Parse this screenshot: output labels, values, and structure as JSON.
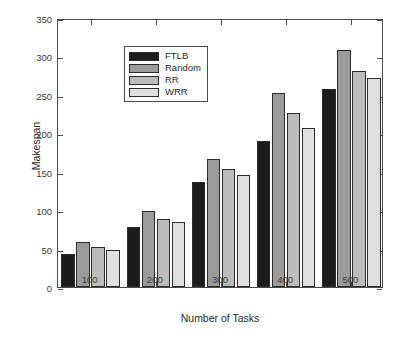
{
  "chart_data": {
    "type": "bar",
    "title": "",
    "xlabel": "Number of Tasks",
    "ylabel": "Makespan",
    "categories": [
      "100",
      "200",
      "300",
      "400",
      "500"
    ],
    "series": [
      {
        "name": "FTLB",
        "color": "#1c1c1c",
        "values": [
          43,
          78,
          137,
          190,
          258
        ]
      },
      {
        "name": "Random",
        "color": "#9b9b9b",
        "values": [
          58,
          99,
          167,
          252,
          308
        ]
      },
      {
        "name": "RR",
        "color": "#bcbcbc",
        "values": [
          52,
          88,
          154,
          226,
          281
        ]
      },
      {
        "name": "WRR",
        "color": "#e0e0e0",
        "values": [
          48,
          84,
          146,
          207,
          272
        ]
      }
    ],
    "ylim": [
      0,
      350
    ],
    "yticks": [
      0,
      50,
      100,
      150,
      200,
      250,
      300,
      350
    ],
    "ytick_labels": [
      "0",
      "50",
      "100",
      "150",
      "200",
      "250",
      "300",
      "350"
    ],
    "grid": false,
    "legend_position": "upper left",
    "legend_entries": [
      "FTLB",
      "Random",
      "RR",
      "WRR"
    ]
  }
}
